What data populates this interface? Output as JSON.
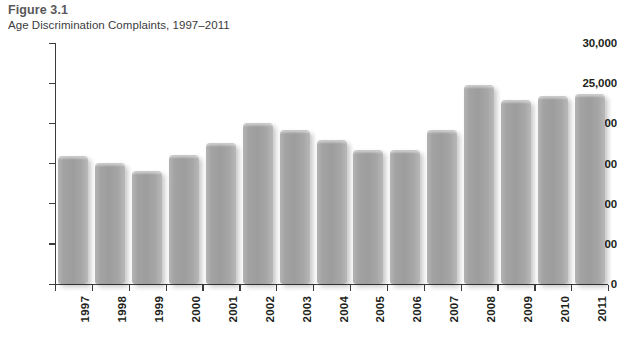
{
  "figure": {
    "number": "Figure 3.1",
    "caption": "Age Discrimination Complaints, 1997–2011"
  },
  "chart_data": {
    "type": "bar",
    "title": "Age Discrimination Complaints, 1997–2011",
    "xlabel": "",
    "ylabel": "",
    "ylim": [
      0,
      30000
    ],
    "grid": false,
    "legend": null,
    "bar_color": "#a3a3a3",
    "axis_color": "#3b3b3d",
    "ytick_labels": [
      "0",
      "5,000",
      "10,000",
      "15,000",
      "20,000",
      "25,000",
      "30,000"
    ],
    "ytick_values": [
      0,
      5000,
      10000,
      15000,
      20000,
      25000,
      30000
    ],
    "categories": [
      "1997",
      "1998",
      "1999",
      "2000",
      "2001",
      "2002",
      "2003",
      "2004",
      "2005",
      "2006",
      "2007",
      "2008",
      "2009",
      "2010",
      "2011"
    ],
    "values": [
      15800,
      15000,
      13900,
      15900,
      17400,
      19900,
      19100,
      17800,
      16600,
      16500,
      19100,
      24600,
      22800,
      23300,
      23500
    ]
  }
}
